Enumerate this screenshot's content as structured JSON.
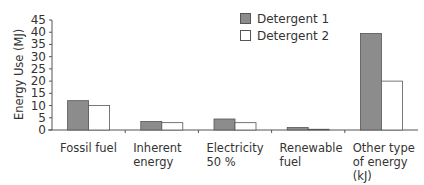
{
  "chart_data": {
    "type": "bar",
    "title": "",
    "xlabel": "",
    "ylabel": "Energy Use (MJ)",
    "ylim": [
      0,
      45
    ],
    "yticks": [
      0,
      5,
      10,
      15,
      20,
      25,
      30,
      35,
      40,
      45
    ],
    "grid": false,
    "legend_position": "top-right",
    "categories": [
      "Fossil fuel",
      "Inherent energy",
      "Electricity 50 %",
      "Renewable fuel",
      "Other type of energy (kJ)"
    ],
    "category_lines": [
      [
        "Fossil fuel"
      ],
      [
        "Inherent",
        "energy"
      ],
      [
        "Electricity",
        "50 %"
      ],
      [
        "Renewable",
        "fuel"
      ],
      [
        "Other type",
        "of energy",
        "(kJ)"
      ]
    ],
    "series": [
      {
        "name": "Detergent 1",
        "color": "#8c8c8c",
        "values": [
          12,
          3.5,
          4.5,
          1,
          39.5
        ]
      },
      {
        "name": "Detergent 2",
        "color": "#ffffff",
        "values": [
          10,
          3,
          3,
          0.3,
          20
        ]
      }
    ]
  }
}
